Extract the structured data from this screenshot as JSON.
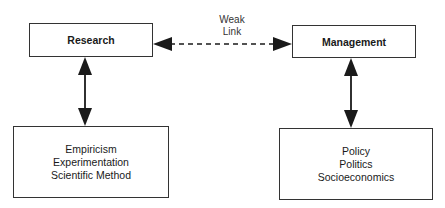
{
  "diagram": {
    "nodes": {
      "research": {
        "label": "Research"
      },
      "management": {
        "label": "Management"
      },
      "research_methods": {
        "items": [
          "Empiricism",
          "Experimentation",
          "Scientific Method"
        ]
      },
      "management_factors": {
        "items": [
          "Policy",
          "Politics",
          "Socioeconomics"
        ]
      }
    },
    "edges": {
      "weak_link": {
        "label_line1": "Weak",
        "label_line2": "Link",
        "style": "dashed",
        "from": "Research",
        "to": "Management",
        "bidirectional": true
      },
      "research_link": {
        "from": "Research",
        "to": "Empiricism / Experimentation / Scientific Method",
        "bidirectional": true
      },
      "management_link": {
        "from": "Management",
        "to": "Policy / Politics / Socioeconomics",
        "bidirectional": true
      }
    },
    "colors": {
      "line": "#1a1a1a",
      "border": "#333333",
      "background": "#ffffff"
    }
  }
}
